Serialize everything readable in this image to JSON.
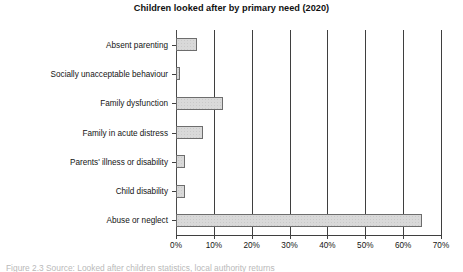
{
  "chart_data": {
    "type": "bar",
    "orientation": "horizontal",
    "title": "Children looked after by primary need (2020)",
    "xlabel": "",
    "ylabel": "",
    "categories": [
      "Absent parenting",
      "Socially unacceptable behaviour",
      "Family dysfunction",
      "Family in acute distress",
      "Parents' illness or disability",
      "Child disability",
      "Abuse or neglect"
    ],
    "values": [
      5.5,
      1.0,
      12.5,
      7.0,
      2.5,
      2.5,
      65.0
    ],
    "xlim": [
      0,
      70
    ],
    "xticks": [
      0,
      10,
      20,
      30,
      40,
      50,
      60,
      70
    ],
    "xticklabels": [
      "0%",
      "10%",
      "20%",
      "30%",
      "40%",
      "50%",
      "60%",
      "70%"
    ],
    "grid": "vertical",
    "legend": "none",
    "bar_fill": "#d9d9d9",
    "bar_edge": "#6d6d6d",
    "axis_color": "#3f3f3f"
  },
  "caption": {
    "text": "Figure 2.3  Source: Looked after children statistics, local authority returns"
  }
}
